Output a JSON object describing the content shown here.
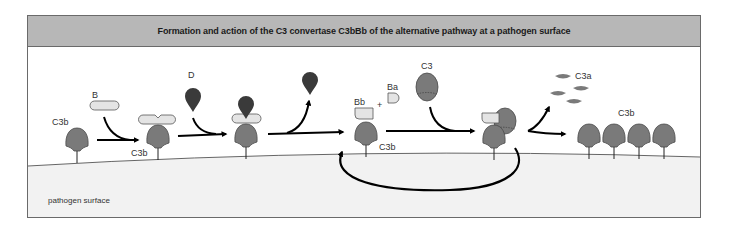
{
  "title": "Formation and action of the C3 convertase C3bBb of the alternative pathway at a pathogen surface",
  "labels": {
    "c3b_first": "C3b",
    "b": "B",
    "c3b_second": "C3b",
    "d": "D",
    "bb": "Bb",
    "plus": "+",
    "ba": "Ba",
    "c3b_third": "C3b",
    "c3": "C3",
    "c3a": "C3a",
    "c3b_cluster": "C3b",
    "surface": "pathogen surface"
  },
  "colors": {
    "header_bg": "#b7b7b7",
    "frame_border": "#6a6a6a",
    "protein_fill": "#7a7a7a",
    "protein_stroke": "#4a4a4a",
    "factor_b_fill": "#e4e4e4",
    "factor_d_fill": "#3a3a3a",
    "surface_fill": "#f2f2f2",
    "arrow": "#000000"
  },
  "steps": [
    {
      "step": 1,
      "description": "C3b bound to pathogen surface"
    },
    {
      "step": 2,
      "description": "Factor B binds C3b"
    },
    {
      "step": 3,
      "description": "Factor D cleaves bound B"
    },
    {
      "step": 4,
      "description": "D released; Ba released; C3bBb convertase formed"
    },
    {
      "step": 5,
      "description": "C3bBb binds C3"
    },
    {
      "step": 6,
      "description": "C3 cleaved to C3a (released) and C3b (deposited on surface); feedback loop amplifies"
    }
  ]
}
